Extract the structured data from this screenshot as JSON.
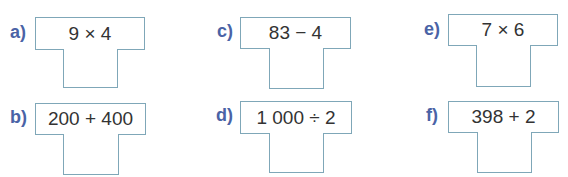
{
  "exercises": [
    {
      "label": "a)",
      "expression": "9 × 4",
      "answer": ""
    },
    {
      "label": "b)",
      "expression": "200 + 400",
      "answer": ""
    },
    {
      "label": "c)",
      "expression": "83 − 4",
      "answer": ""
    },
    {
      "label": "d)",
      "expression": "1 000 ÷ 2",
      "answer": ""
    },
    {
      "label": "e)",
      "expression": "7 × 6",
      "answer": ""
    },
    {
      "label": "f)",
      "expression": "398 + 2",
      "answer": ""
    }
  ],
  "colors": {
    "label": "#4a63a6",
    "border": "#7fa7b8",
    "text": "#333333"
  }
}
